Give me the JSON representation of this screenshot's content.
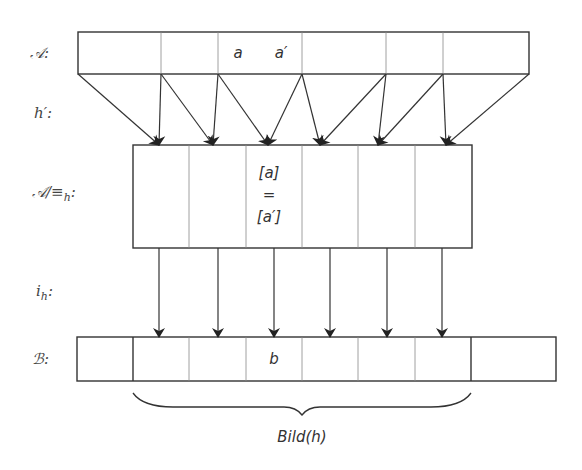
{
  "labels": {
    "A": "𝒜:",
    "h_prime": "h′:",
    "quotient_prefix": "𝒜/≡",
    "quotient_sub": "h",
    "quotient_suffix": ":",
    "i_prefix": "i",
    "i_sub": "h",
    "i_suffix": ":",
    "B": "ℬ:"
  },
  "top_box": {
    "x": 78,
    "y": 32,
    "w": 451,
    "h": 42,
    "dividers": [
      161,
      218,
      302,
      386,
      443
    ],
    "elements": [
      {
        "text": "a",
        "x": 236,
        "y": 45
      },
      {
        "text": "a′",
        "x": 279,
        "y": 45
      }
    ]
  },
  "middle_box": {
    "x": 133,
    "y": 145,
    "w": 339,
    "h": 103,
    "dividers": [
      189,
      246,
      302,
      358,
      415
    ],
    "class_lines": [
      "[a]",
      "=",
      "[a′]"
    ]
  },
  "bottom_box": {
    "x": 77,
    "y": 337,
    "w": 479,
    "h": 44,
    "dividers": [
      133,
      189,
      246,
      302,
      358,
      415,
      471
    ],
    "bold_dividers": [
      133,
      471
    ],
    "element": "b"
  },
  "h_prime_arrows": [
    {
      "from": [
        78,
        74
      ],
      "to": [
        159,
        145
      ]
    },
    {
      "from": [
        161,
        74
      ],
      "to": [
        159,
        145
      ]
    },
    {
      "from": [
        161,
        74
      ],
      "to": [
        213,
        145
      ]
    },
    {
      "from": [
        218,
        74
      ],
      "to": [
        213,
        145
      ]
    },
    {
      "from": [
        218,
        74
      ],
      "to": [
        268,
        145
      ]
    },
    {
      "from": [
        302,
        74
      ],
      "to": [
        268,
        145
      ]
    },
    {
      "from": [
        302,
        74
      ],
      "to": [
        320,
        145
      ]
    },
    {
      "from": [
        386,
        74
      ],
      "to": [
        320,
        145
      ]
    },
    {
      "from": [
        386,
        74
      ],
      "to": [
        378,
        145
      ]
    },
    {
      "from": [
        443,
        74
      ],
      "to": [
        378,
        145
      ]
    },
    {
      "from": [
        443,
        74
      ],
      "to": [
        446,
        145
      ]
    },
    {
      "from": [
        529,
        74
      ],
      "to": [
        446,
        145
      ]
    }
  ],
  "i_h_arrows": [
    {
      "x": 159
    },
    {
      "x": 218
    },
    {
      "x": 274
    },
    {
      "x": 330
    },
    {
      "x": 387
    },
    {
      "x": 442
    }
  ],
  "brace": {
    "x1": 133,
    "x2": 471,
    "y": 393,
    "label": "Bild(h)"
  },
  "colors": {
    "line": "#333333",
    "divider": "#888888",
    "text": "#333333"
  }
}
